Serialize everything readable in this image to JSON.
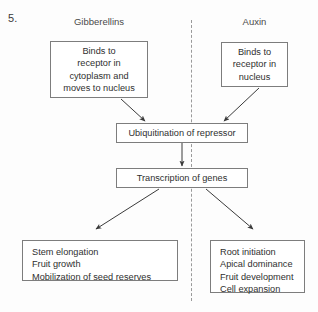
{
  "question": {
    "number": "5."
  },
  "columns": [
    {
      "id": "gibberellins",
      "label": "Gibberellins"
    },
    {
      "id": "auxin",
      "label": "Auxin"
    }
  ],
  "divider": {
    "style": "dashed-vertical",
    "color": "#9a9a9a"
  },
  "boxes": {
    "gibberellin_action": {
      "lines": [
        "Binds to",
        "receptor in",
        "cytoplasm and",
        "moves to nucleus"
      ]
    },
    "auxin_action": {
      "lines": [
        "Binds to",
        "receptor in",
        "nucleus"
      ]
    },
    "ubiquitination": {
      "text": "Ubiquitination of repressor"
    },
    "transcription": {
      "text": "Transcription of genes"
    },
    "gibberellin_effects": {
      "lines": [
        "Stem elongation",
        "Fruit growth",
        "Mobilization of seed reserves"
      ]
    },
    "auxin_effects": {
      "lines": [
        "Root initiation",
        "Apical dominance",
        "Fruit development",
        "Cell expansion"
      ]
    }
  },
  "arrows": [
    {
      "id": "gibberellin-to-ubiquitination",
      "from": "gibberellin_action",
      "to": "ubiquitination",
      "direction": "down-right"
    },
    {
      "id": "auxin-to-ubiquitination",
      "from": "auxin_action",
      "to": "ubiquitination",
      "direction": "down-left"
    },
    {
      "id": "ubiquitination-to-transcription",
      "from": "ubiquitination",
      "to": "transcription",
      "direction": "down"
    },
    {
      "id": "transcription-to-gibberellin-effects",
      "from": "transcription",
      "to": "gibberellin_effects",
      "direction": "down-left"
    },
    {
      "id": "transcription-to-auxin-effects",
      "from": "transcription",
      "to": "auxin_effects",
      "direction": "down-right"
    }
  ],
  "colors": {
    "box_border": "#7d7d7d",
    "text": "#2f2f2f",
    "arrow": "#3a3a3a",
    "background": "#fdfdfd"
  }
}
